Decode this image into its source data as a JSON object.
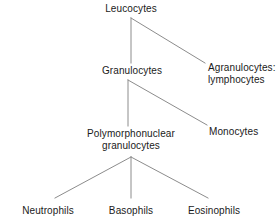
{
  "diagram": {
    "type": "tree",
    "background_color": "#ffffff",
    "line_color": "#8c8c8c",
    "text_color": "#1a1a1a",
    "nodes": [
      {
        "id": "leucocytes",
        "label": "Leucocytes",
        "label_line2": "",
        "x": 131,
        "y": 3,
        "align": "center"
      },
      {
        "id": "granulocytes",
        "label": "Granulocytes",
        "label_line2": "",
        "x": 132,
        "y": 65,
        "align": "center"
      },
      {
        "id": "agranulocytes",
        "label": "Agranulocytes:",
        "label_line2": "lymphocytes",
        "x": 208,
        "y": 62,
        "align": "left"
      },
      {
        "id": "pmn-granulocytes",
        "label": "Polymorphonuclear",
        "label_line2": "granulocytes",
        "x": 131,
        "y": 128,
        "align": "center"
      },
      {
        "id": "monocytes",
        "label": "Monocytes",
        "label_line2": "",
        "x": 209,
        "y": 126,
        "align": "left"
      },
      {
        "id": "neutrophils",
        "label": "Neutrophils",
        "label_line2": "",
        "x": 48,
        "y": 205,
        "align": "center"
      },
      {
        "id": "basophils",
        "label": "Basophils",
        "label_line2": "",
        "x": 131,
        "y": 205,
        "align": "center"
      },
      {
        "id": "eosinophils",
        "label": "Eosinophils",
        "label_line2": "",
        "x": 214,
        "y": 205,
        "align": "center"
      }
    ],
    "edges": [
      {
        "id": "leucocytes-to-granulocytes",
        "from": "leucocytes",
        "to": "granulocytes",
        "x1": 131,
        "y1": 18,
        "x2": 131,
        "y2": 63
      },
      {
        "id": "leucocytes-to-agranulocytes",
        "from": "leucocytes",
        "to": "agranulocytes",
        "x1": 131,
        "y1": 18,
        "x2": 205,
        "y2": 63
      },
      {
        "id": "granulocytes-to-pmn",
        "from": "granulocytes",
        "to": "pmn-granulocytes",
        "x1": 128,
        "y1": 80,
        "x2": 128,
        "y2": 126
      },
      {
        "id": "granulocytes-to-monocytes",
        "from": "granulocytes",
        "to": "monocytes",
        "x1": 128,
        "y1": 80,
        "x2": 207,
        "y2": 125
      },
      {
        "id": "pmn-to-neutrophils",
        "from": "pmn-granulocytes",
        "to": "neutrophils",
        "x1": 131,
        "y1": 157,
        "x2": 55,
        "y2": 198
      },
      {
        "id": "pmn-to-basophils",
        "from": "pmn-granulocytes",
        "to": "basophils",
        "x1": 131,
        "y1": 157,
        "x2": 131,
        "y2": 198
      },
      {
        "id": "pmn-to-eosinophils",
        "from": "pmn-granulocytes",
        "to": "eosinophils",
        "x1": 131,
        "y1": 157,
        "x2": 208,
        "y2": 198
      }
    ]
  }
}
